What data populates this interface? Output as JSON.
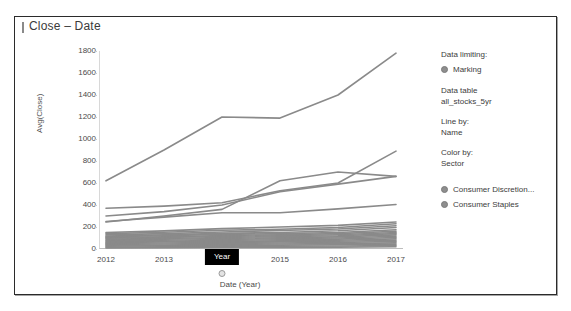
{
  "panel": {
    "title": "Close – Date"
  },
  "legend": {
    "data_limiting_label": "Data limiting:",
    "marking_label": "Marking",
    "data_table_label": "Data table",
    "data_table_value": "all_stocks_5yr",
    "line_by_label": "Line by:",
    "line_by_value": "Name",
    "color_by_label": "Color by:",
    "color_by_value": "Sector",
    "items": [
      {
        "label": "Consumer Discretion...",
        "color": "#8e8e8e"
      },
      {
        "label": "Consumer Staples",
        "color": "#8e8e8e"
      }
    ]
  },
  "tooltip": {
    "label": "Year"
  },
  "chart_data": {
    "type": "line",
    "title": "Close – Date",
    "xlabel": "Date (Year)",
    "ylabel": "Avg(Close)",
    "x": [
      2012,
      2013,
      2014,
      2015,
      2016,
      2017
    ],
    "xtick_labels": [
      "2012",
      "2013",
      "2015",
      "2016",
      "2017"
    ],
    "xtick_values": [
      2012,
      2013,
      2015,
      2016,
      2017
    ],
    "hidden_xtick_value": 2014,
    "ylim": [
      0,
      1800
    ],
    "yticks": [
      0,
      200,
      400,
      600,
      800,
      1000,
      1200,
      1400,
      1600,
      1800
    ],
    "ytick_labels": [
      "0",
      "200",
      "400",
      "600",
      "800",
      "1000",
      "1200",
      "1400",
      "1600",
      "1800"
    ],
    "grid": false,
    "legend_position": "right",
    "line_color": "#8a8a8a",
    "series": [
      {
        "name": "line-1",
        "values": [
          620,
          900,
          1200,
          1190,
          1400,
          1780
        ]
      },
      {
        "name": "line-2",
        "values": [
          370,
          390,
          420,
          530,
          600,
          890
        ]
      },
      {
        "name": "line-3",
        "values": [
          300,
          340,
          400,
          520,
          590,
          660
        ]
      },
      {
        "name": "line-4",
        "values": [
          245,
          300,
          360,
          620,
          700,
          660
        ]
      },
      {
        "name": "line-5",
        "values": [
          250,
          290,
          330,
          330,
          365,
          405
        ]
      },
      {
        "name": "line-6",
        "values": [
          150,
          165,
          185,
          200,
          215,
          245
        ]
      },
      {
        "name": "line-7",
        "values": [
          140,
          152,
          170,
          180,
          196,
          230
        ]
      },
      {
        "name": "line-8",
        "values": [
          128,
          140,
          155,
          168,
          182,
          212
        ]
      },
      {
        "name": "line-9",
        "values": [
          118,
          128,
          142,
          150,
          166,
          196
        ]
      },
      {
        "name": "line-10",
        "values": [
          112,
          120,
          133,
          140,
          150,
          175
        ]
      },
      {
        "name": "line-11",
        "values": [
          105,
          112,
          122,
          130,
          140,
          162
        ]
      },
      {
        "name": "line-12",
        "values": [
          98,
          104,
          114,
          120,
          130,
          150
        ]
      },
      {
        "name": "line-13",
        "values": [
          90,
          96,
          105,
          112,
          120,
          140
        ]
      },
      {
        "name": "line-14",
        "values": [
          82,
          88,
          96,
          102,
          110,
          128
        ]
      },
      {
        "name": "line-15",
        "values": [
          74,
          80,
          87,
          93,
          100,
          116
        ]
      },
      {
        "name": "line-16",
        "values": [
          66,
          71,
          78,
          84,
          90,
          104
        ]
      },
      {
        "name": "line-17",
        "values": [
          58,
          63,
          69,
          74,
          80,
          92
        ]
      },
      {
        "name": "line-18",
        "values": [
          50,
          54,
          60,
          65,
          70,
          80
        ]
      },
      {
        "name": "line-19",
        "values": [
          42,
          46,
          51,
          55,
          60,
          68
        ]
      },
      {
        "name": "line-20",
        "values": [
          34,
          37,
          42,
          45,
          49,
          56
        ]
      },
      {
        "name": "line-21",
        "values": [
          26,
          29,
          32,
          35,
          38,
          44
        ]
      },
      {
        "name": "line-22",
        "values": [
          18,
          20,
          23,
          25,
          27,
          32
        ]
      },
      {
        "name": "line-23",
        "values": [
          10,
          12,
          14,
          15,
          17,
          20
        ]
      }
    ]
  }
}
